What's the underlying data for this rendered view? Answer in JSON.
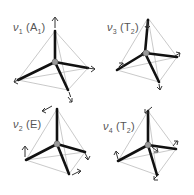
{
  "figure": {
    "panels": [
      {
        "id": "nu1",
        "symbol": "ν",
        "index": "1",
        "symmetry": "A",
        "symmetry_sub": "1"
      },
      {
        "id": "nu3",
        "symbol": "ν",
        "index": "3",
        "symmetry": "T",
        "symmetry_sub": "2"
      },
      {
        "id": "nu2",
        "symbol": "ν",
        "index": "2",
        "symmetry": "E",
        "symmetry_sub": ""
      },
      {
        "id": "nu4",
        "symbol": "ν",
        "index": "4",
        "symmetry": "T",
        "symmetry_sub": "2"
      }
    ]
  },
  "colors": {
    "bond": "#111111",
    "edge": "#bbbbbb",
    "arrow": "#333333",
    "center_atom": "#999999",
    "label": "#555555"
  }
}
